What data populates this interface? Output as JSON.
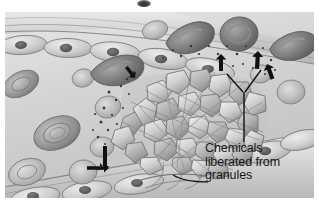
{
  "figure": {
    "kind": "medical-illustration",
    "style": "grayscale airbrush halftone",
    "background_color": "#ffffff",
    "plate_color": "#d8d8d8",
    "ink_color": "#171717"
  },
  "caption": {
    "line1": "Chemicals",
    "line2": "liberated from",
    "line3": "granules",
    "full_text": "Chemicals liberated from granules",
    "color": "#171717"
  },
  "annotations": {
    "leader": "y-shaped-leader-line",
    "arrows": [
      {
        "name": "arrow-up-left-upper",
        "direction": "up-left"
      },
      {
        "name": "arrow-up-left-inner",
        "direction": "up-left"
      },
      {
        "name": "arrow-up-outer",
        "direction": "up"
      },
      {
        "name": "arrow-up-inner",
        "direction": "up"
      },
      {
        "name": "arrow-left-lower",
        "direction": "left"
      }
    ]
  },
  "anatomy": {
    "vessel_wall_top": "endothelial-cell-layer",
    "vessel_wall_bottom": "endothelial-cell-layer",
    "lumen": "blood-plasma",
    "red_blood_cells": 14,
    "platelet_plug": "aggregated-platelets-with-pseudopods",
    "granule_dots": "released-chemical-granules",
    "breach": "vessel-wall-injury-site"
  }
}
